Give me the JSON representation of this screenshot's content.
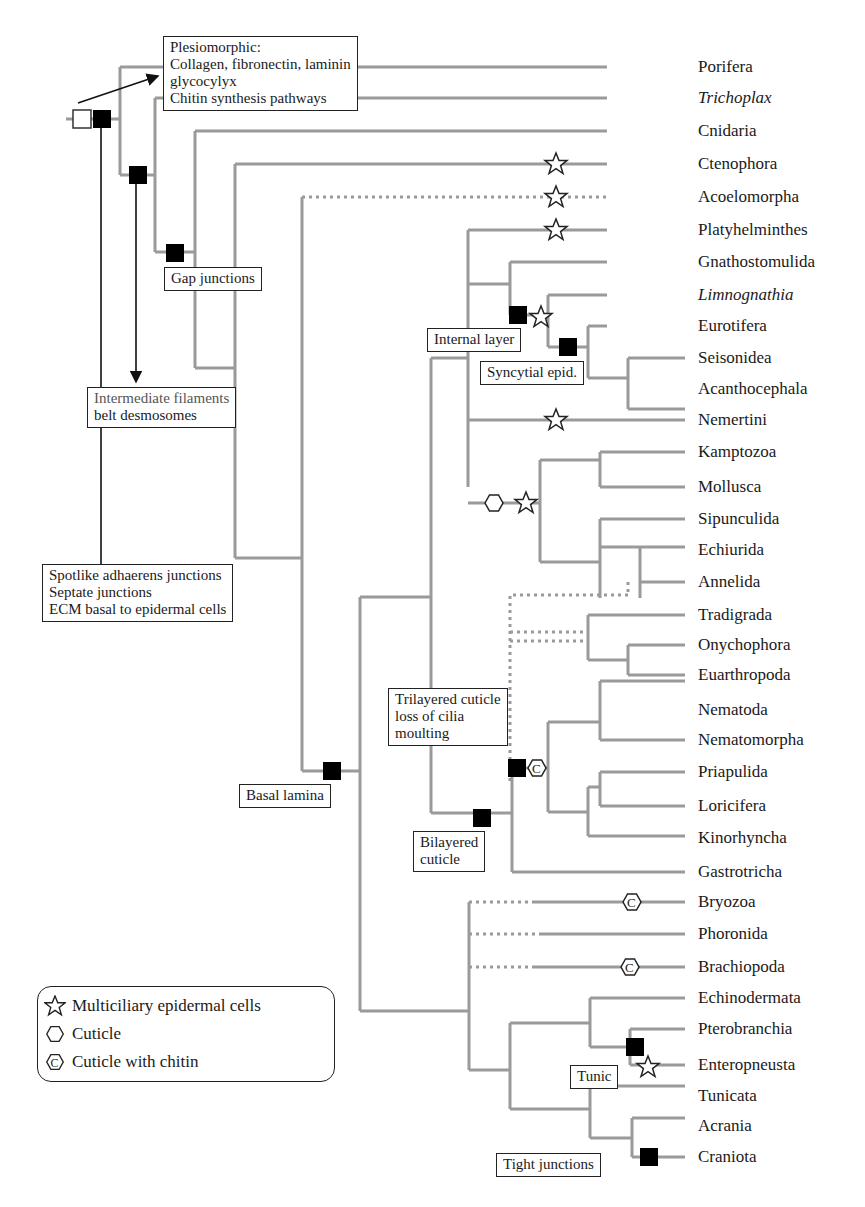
{
  "diagram": {
    "type": "phylogenetic-tree",
    "colors": {
      "branch": "#9a9a9a",
      "marker": "#000000",
      "box_border": "#222222"
    },
    "taxa": [
      {
        "name": "Porifera",
        "italic": false
      },
      {
        "name": "Trichoplax",
        "italic": true
      },
      {
        "name": "Cnidaria",
        "italic": false
      },
      {
        "name": "Ctenophora",
        "italic": false
      },
      {
        "name": "Acoelomorpha",
        "italic": false
      },
      {
        "name": "Platyhelminthes",
        "italic": false
      },
      {
        "name": "Gnathostomulida",
        "italic": false
      },
      {
        "name": "Limnognathia",
        "italic": true
      },
      {
        "name": "Eurotifera",
        "italic": false
      },
      {
        "name": "Seisonidea",
        "italic": false
      },
      {
        "name": "Acanthocephala",
        "italic": false
      },
      {
        "name": "Nemertini",
        "italic": false
      },
      {
        "name": "Kamptozoa",
        "italic": false
      },
      {
        "name": "Mollusca",
        "italic": false
      },
      {
        "name": "Sipunculida",
        "italic": false
      },
      {
        "name": "Echiurida",
        "italic": false
      },
      {
        "name": "Annelida",
        "italic": false
      },
      {
        "name": "Tradigrada",
        "italic": false
      },
      {
        "name": "Onychophora",
        "italic": false
      },
      {
        "name": "Euarthropoda",
        "italic": false
      },
      {
        "name": "Nematoda",
        "italic": false
      },
      {
        "name": "Nematomorpha",
        "italic": false
      },
      {
        "name": "Priapulida",
        "italic": false
      },
      {
        "name": "Loricifera",
        "italic": false
      },
      {
        "name": "Kinorhyncha",
        "italic": false
      },
      {
        "name": "Gastrotricha",
        "italic": false
      },
      {
        "name": "Bryozoa",
        "italic": false
      },
      {
        "name": "Phoronida",
        "italic": false
      },
      {
        "name": "Brachiopoda",
        "italic": false
      },
      {
        "name": "Echinodermata",
        "italic": false
      },
      {
        "name": "Pterobranchia",
        "italic": false
      },
      {
        "name": "Enteropneusta",
        "italic": false
      },
      {
        "name": "Tunicata",
        "italic": false
      },
      {
        "name": "Acrania",
        "italic": false
      },
      {
        "name": "Craniota",
        "italic": false
      }
    ],
    "annotations": {
      "plesiomorphic": [
        "Plesiomorphic:",
        "Collagen, fibronectin, laminin",
        "glycocylyx",
        "Chitin synthesis pathways"
      ],
      "gap_junctions": [
        "Gap junctions"
      ],
      "intermediate_filaments": [
        "Intermediate filaments",
        "belt desmosomes"
      ],
      "spotlike": [
        "Spotlike adhaerens junctions",
        "Septate junctions",
        "ECM basal to epidermal cells"
      ],
      "basal_lamina": [
        "Basal lamina"
      ],
      "internal_layer": [
        "Internal layer"
      ],
      "syncytial": [
        "Syncytial epid."
      ],
      "trilayered": [
        "Trilayered cuticle",
        "loss of cilia",
        "moulting"
      ],
      "bilayered": [
        "Bilayered",
        "cuticle"
      ],
      "tunic": [
        "Tunic"
      ],
      "tight_junctions": [
        "Tight junctions"
      ]
    },
    "legend": [
      {
        "icon": "star-icon",
        "label": "Multiciliary epidermal cells"
      },
      {
        "icon": "hexagon-icon",
        "label": "Cuticle"
      },
      {
        "icon": "hexagon-c-icon",
        "label": "Cuticle with chitin"
      }
    ]
  }
}
